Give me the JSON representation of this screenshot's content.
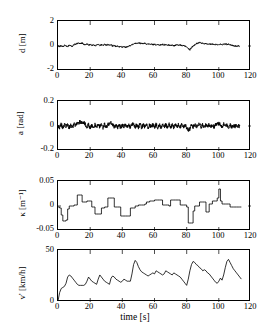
{
  "figure": {
    "title": "",
    "background_color": "#ffffff",
    "line_color": "#000000",
    "axis_color": "#000000",
    "xlabel": "time [s]",
    "n_panels": 4
  },
  "chart_data": [
    {
      "type": "line",
      "title": "",
      "xlabel": "",
      "ylabel": "d [m]",
      "ylabel_symbol": "d",
      "ylabel_unit": "m",
      "xlim": [
        0,
        120
      ],
      "ylim": [
        -2,
        2
      ],
      "xticks": [
        0,
        20,
        40,
        60,
        80,
        100,
        120
      ],
      "xticklabels": [
        "0",
        "20",
        "40",
        "60",
        "80",
        "100",
        "120"
      ],
      "yticks": [
        -2,
        0,
        2
      ],
      "yticklabels": [
        "-2",
        "0",
        "2"
      ],
      "grid": false,
      "legend": null,
      "x": [
        0,
        1,
        2,
        3,
        4,
        5,
        6,
        7,
        8,
        9,
        10,
        11,
        12,
        13,
        14,
        15,
        16,
        17,
        18,
        19,
        20,
        21,
        22,
        23,
        24,
        25,
        26,
        27,
        28,
        29,
        30,
        31,
        32,
        33,
        34,
        35,
        36,
        37,
        38,
        39,
        40,
        41,
        42,
        43,
        44,
        45,
        46,
        47,
        48,
        49,
        50,
        51,
        52,
        53,
        54,
        55,
        56,
        57,
        58,
        59,
        60,
        61,
        62,
        63,
        64,
        65,
        66,
        67,
        68,
        69,
        70,
        71,
        72,
        73,
        74,
        75,
        76,
        77,
        78,
        79,
        80,
        81,
        82,
        83,
        84,
        85,
        86,
        87,
        88,
        89,
        90,
        91,
        92,
        93,
        94,
        95,
        96,
        97,
        98,
        99,
        100,
        101,
        102,
        103,
        104,
        105,
        106,
        107,
        108,
        109,
        110,
        111,
        112,
        113,
        114
      ],
      "values": [
        0.0,
        -0.05,
        0.04,
        -0.08,
        0.05,
        0.0,
        -0.06,
        0.08,
        0.02,
        -0.04,
        0.1,
        0.16,
        0.2,
        0.22,
        0.18,
        0.24,
        0.14,
        0.1,
        0.16,
        0.08,
        0.12,
        0.06,
        0.1,
        0.02,
        0.08,
        0.12,
        0.04,
        0.1,
        0.06,
        0.14,
        0.08,
        0.12,
        0.05,
        0.1,
        -0.02,
        0.04,
        -0.06,
        0.0,
        -0.08,
        -0.02,
        -0.1,
        -0.04,
        -0.12,
        -0.06,
        -0.02,
        0.04,
        0.1,
        0.16,
        0.2,
        0.22,
        0.26,
        0.2,
        0.24,
        0.18,
        0.22,
        0.14,
        0.18,
        0.12,
        0.16,
        0.1,
        0.14,
        0.08,
        0.12,
        0.06,
        0.1,
        0.14,
        0.08,
        0.12,
        0.06,
        0.1,
        0.04,
        0.08,
        0.02,
        0.06,
        0.1,
        0.04,
        0.08,
        0.02,
        0.06,
        0.0,
        -0.04,
        -0.18,
        -0.3,
        -0.12,
        0.0,
        0.08,
        0.18,
        0.24,
        0.3,
        0.22,
        0.26,
        0.18,
        0.22,
        0.14,
        0.18,
        0.12,
        0.16,
        0.1,
        0.14,
        0.08,
        0.12,
        0.16,
        0.1,
        0.14,
        0.18,
        0.12,
        0.16,
        0.1,
        0.06,
        0.02,
        0.0,
        -0.02,
        0.0,
        0.0
      ]
    },
    {
      "type": "line",
      "title": "",
      "xlabel": "",
      "ylabel": "a [rad]",
      "ylabel_symbol": "a",
      "ylabel_unit": "rad",
      "xlim": [
        0,
        120
      ],
      "ylim": [
        -0.2,
        0.2
      ],
      "xticks": [
        0,
        20,
        40,
        60,
        80,
        100,
        120
      ],
      "xticklabels": [
        "0",
        "20",
        "40",
        "60",
        "80",
        "100",
        "120"
      ],
      "yticks": [
        -0.2,
        0,
        0.2
      ],
      "yticklabels": [
        "-0.2",
        "0",
        "0.2"
      ],
      "grid": false,
      "legend": null,
      "x": [
        0,
        1,
        2,
        3,
        4,
        5,
        6,
        7,
        8,
        9,
        10,
        11,
        12,
        13,
        14,
        15,
        16,
        17,
        18,
        19,
        20,
        21,
        22,
        23,
        24,
        25,
        26,
        27,
        28,
        29,
        30,
        31,
        32,
        33,
        34,
        35,
        36,
        37,
        38,
        39,
        40,
        41,
        42,
        43,
        44,
        45,
        46,
        47,
        48,
        49,
        50,
        51,
        52,
        53,
        54,
        55,
        56,
        57,
        58,
        59,
        60,
        61,
        62,
        63,
        64,
        65,
        66,
        67,
        68,
        69,
        70,
        71,
        72,
        73,
        74,
        75,
        76,
        77,
        78,
        79,
        80,
        81,
        82,
        83,
        84,
        85,
        86,
        87,
        88,
        89,
        90,
        91,
        92,
        93,
        94,
        95,
        96,
        97,
        98,
        99,
        100,
        101,
        102,
        103,
        104,
        105,
        106,
        107,
        108,
        109,
        110,
        111,
        112,
        113,
        114
      ],
      "values": [
        0.0,
        -0.012,
        0.014,
        -0.016,
        0.01,
        -0.006,
        0.012,
        -0.014,
        0.008,
        -0.01,
        0.014,
        0.006,
        0.02,
        0.028,
        0.034,
        0.026,
        0.03,
        0.012,
        -0.008,
        0.01,
        -0.012,
        0.008,
        -0.014,
        0.01,
        -0.008,
        0.012,
        -0.01,
        0.008,
        -0.012,
        0.014,
        -0.01,
        0.012,
        0.018,
        0.026,
        0.014,
        -0.01,
        0.008,
        -0.012,
        0.01,
        -0.014,
        0.008,
        -0.01,
        0.012,
        -0.008,
        0.01,
        -0.012,
        0.014,
        0.01,
        -0.008,
        0.012,
        -0.01,
        0.014,
        -0.012,
        0.01,
        -0.008,
        0.012,
        -0.014,
        0.01,
        -0.01,
        0.012,
        -0.008,
        0.014,
        -0.012,
        0.01,
        -0.014,
        0.012,
        -0.008,
        0.01,
        -0.012,
        0.014,
        -0.01,
        0.008,
        -0.014,
        0.012,
        -0.01,
        0.014,
        -0.008,
        0.01,
        -0.012,
        0.008,
        -0.016,
        -0.03,
        -0.024,
        0.014,
        -0.01,
        0.012,
        -0.008,
        0.014,
        0.02,
        -0.012,
        0.01,
        -0.014,
        0.012,
        -0.01,
        0.014,
        -0.008,
        0.012,
        -0.012,
        0.01,
        0.014,
        0.018,
        0.012,
        -0.01,
        0.014,
        -0.008,
        0.012,
        -0.01,
        0.008,
        -0.006,
        0.004,
        -0.004,
        0.002,
        0.0,
        0.0
      ]
    },
    {
      "type": "line",
      "title": "",
      "xlabel": "",
      "ylabel": "κ [m⁻¹]",
      "ylabel_symbol": "κ",
      "ylabel_unit": "m⁻¹",
      "xlim": [
        0,
        120
      ],
      "ylim": [
        -0.05,
        0.05
      ],
      "xticks": [
        0,
        20,
        40,
        60,
        80,
        100,
        120
      ],
      "xticklabels": [
        "0",
        "20",
        "40",
        "60",
        "80",
        "100",
        "120"
      ],
      "yticks": [
        -0.05,
        0,
        0.05
      ],
      "yticklabels": [
        "-0.05",
        "0",
        "0.05"
      ],
      "grid": false,
      "legend": null,
      "x": [
        0,
        1,
        2,
        3,
        4,
        5,
        6,
        7,
        8,
        9,
        10,
        11,
        12,
        13,
        14,
        15,
        16,
        17,
        18,
        19,
        20,
        21,
        22,
        23,
        24,
        25,
        26,
        27,
        28,
        29,
        30,
        31,
        32,
        33,
        34,
        35,
        36,
        37,
        38,
        39,
        40,
        41,
        42,
        43,
        44,
        45,
        46,
        47,
        48,
        49,
        50,
        51,
        52,
        53,
        54,
        55,
        56,
        57,
        58,
        59,
        60,
        61,
        62,
        63,
        64,
        65,
        66,
        67,
        68,
        69,
        70,
        71,
        72,
        73,
        74,
        75,
        76,
        77,
        78,
        79,
        80,
        81,
        82,
        83,
        84,
        85,
        86,
        87,
        88,
        89,
        90,
        91,
        92,
        93,
        94,
        95,
        96,
        97,
        98,
        99,
        100,
        101,
        102,
        103,
        104,
        105,
        106,
        107,
        108,
        109,
        110,
        111,
        112,
        113,
        114
      ],
      "values": [
        -0.002,
        -0.004,
        -0.018,
        -0.03,
        -0.03,
        -0.028,
        -0.006,
        0.0,
        0.0,
        0.0,
        0.002,
        0.002,
        0.022,
        0.022,
        0.022,
        0.008,
        0.008,
        0.008,
        0.01,
        0.01,
        0.01,
        -0.002,
        -0.002,
        -0.016,
        -0.016,
        -0.016,
        -0.016,
        -0.004,
        -0.004,
        -0.002,
        -0.002,
        0.016,
        0.016,
        0.016,
        0.016,
        -0.002,
        -0.002,
        -0.002,
        -0.002,
        -0.02,
        -0.02,
        -0.02,
        -0.02,
        -0.02,
        -0.02,
        -0.004,
        -0.004,
        -0.004,
        0.0,
        0.0,
        0.002,
        0.002,
        0.002,
        0.002,
        0.004,
        0.008,
        0.008,
        0.01,
        0.01,
        0.01,
        0.012,
        0.012,
        0.012,
        0.012,
        0.012,
        0.002,
        0.002,
        0.002,
        0.002,
        0.0,
        0.012,
        0.012,
        0.012,
        0.012,
        0.012,
        0.012,
        0.002,
        0.002,
        0.002,
        0.002,
        -0.002,
        -0.034,
        -0.034,
        -0.034,
        -0.01,
        0.0,
        0.0,
        0.0,
        0.008,
        0.008,
        0.008,
        0.008,
        -0.012,
        -0.012,
        0.004,
        0.004,
        0.01,
        0.01,
        0.01,
        0.016,
        0.034,
        0.01,
        0.004,
        0.004,
        0.004,
        0.004,
        0.004,
        -0.002,
        -0.002,
        -0.002,
        -0.002,
        -0.002,
        -0.002,
        -0.002,
        -0.002
      ]
    },
    {
      "type": "line",
      "title": "",
      "xlabel": "time [s]",
      "ylabel": "v' [km/h]",
      "ylabel_symbol": "v'",
      "ylabel_unit": "km/h",
      "xlim": [
        0,
        120
      ],
      "ylim": [
        0,
        50
      ],
      "xticks": [
        0,
        20,
        40,
        60,
        80,
        100,
        120
      ],
      "xticklabels": [
        "0",
        "20",
        "40",
        "60",
        "80",
        "100",
        "120"
      ],
      "yticks": [
        0,
        50
      ],
      "yticklabels": [
        "0",
        "50"
      ],
      "grid": false,
      "legend": null,
      "x": [
        0,
        1,
        2,
        3,
        4,
        5,
        6,
        7,
        8,
        9,
        10,
        11,
        12,
        13,
        14,
        15,
        16,
        17,
        18,
        19,
        20,
        21,
        22,
        23,
        24,
        25,
        26,
        27,
        28,
        29,
        30,
        31,
        32,
        33,
        34,
        35,
        36,
        37,
        38,
        39,
        40,
        41,
        42,
        43,
        44,
        45,
        46,
        47,
        48,
        49,
        50,
        51,
        52,
        53,
        54,
        55,
        56,
        57,
        58,
        59,
        60,
        61,
        62,
        63,
        64,
        65,
        66,
        67,
        68,
        69,
        70,
        71,
        72,
        73,
        74,
        75,
        76,
        77,
        78,
        79,
        80,
        81,
        82,
        83,
        84,
        85,
        86,
        87,
        88,
        89,
        90,
        91,
        92,
        93,
        94,
        95,
        96,
        97,
        98,
        99,
        100,
        101,
        102,
        103,
        104,
        105,
        106,
        107,
        108,
        109,
        110,
        111,
        112,
        113,
        114
      ],
      "values": [
        1,
        9,
        13,
        14,
        15,
        18,
        24,
        26,
        25,
        23,
        21,
        19,
        17,
        16,
        16,
        16,
        16,
        17,
        20,
        24,
        22,
        20,
        19,
        18,
        17,
        22,
        26,
        24,
        22,
        20,
        19,
        18,
        17,
        23,
        25,
        24,
        22,
        21,
        20,
        19,
        20,
        22,
        21,
        20,
        20,
        20,
        27,
        36,
        40,
        38,
        34,
        31,
        29,
        28,
        27,
        26,
        25,
        26,
        27,
        28,
        27,
        30,
        29,
        28,
        27,
        26,
        27,
        30,
        29,
        28,
        27,
        26,
        28,
        27,
        26,
        25,
        24,
        22,
        20,
        18,
        16,
        22,
        30,
        36,
        39,
        38,
        36,
        35,
        33,
        32,
        30,
        31,
        30,
        28,
        27,
        25,
        23,
        21,
        19,
        18,
        20,
        23,
        21,
        26,
        33,
        39,
        41,
        38,
        35,
        32,
        30,
        28,
        26,
        24,
        22
      ]
    }
  ],
  "panels": [
    {
      "id": "panel-d",
      "ylabel": "d [m]"
    },
    {
      "id": "panel-a",
      "ylabel": "a [rad]"
    },
    {
      "id": "panel-kappa",
      "ylabel": "κ [m⁻¹]"
    },
    {
      "id": "panel-v",
      "ylabel": "v' [km/h]"
    }
  ]
}
